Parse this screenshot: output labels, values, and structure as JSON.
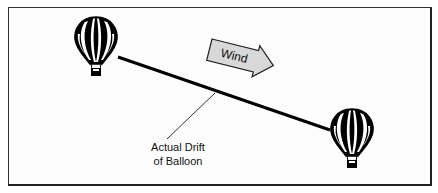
{
  "diagram": {
    "wind_arrow": {
      "label": "Wind",
      "fill": "#d8d8d8"
    },
    "drift_label": {
      "line1": "Actual Drift",
      "line2": "of Balloon"
    },
    "balloons": [
      {
        "id": "start",
        "x": 96,
        "y": 52
      },
      {
        "id": "end",
        "x": 352,
        "y": 142
      }
    ],
    "drift_line": {
      "from": [
        118,
        57
      ],
      "to": [
        330,
        130
      ]
    },
    "colors": {
      "ink": "#000000",
      "frame": "#222222",
      "background": "#ffffff"
    }
  }
}
